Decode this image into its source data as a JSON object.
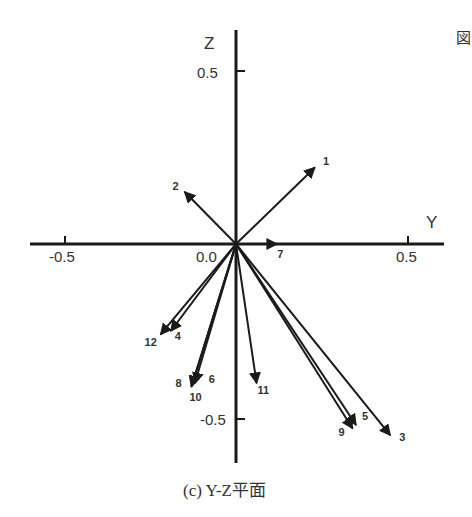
{
  "figure": {
    "fig_mark": "図",
    "caption": "(c) Y-Z平面",
    "y_axis_label": "Y",
    "z_axis_label": "Z",
    "tick_labels": {
      "y_neg": "-0.5",
      "origin": "0.0",
      "y_pos": "0.5",
      "z_pos": "0.5",
      "z_neg": "-0.5"
    }
  },
  "chart_data": {
    "type": "vector-diagram",
    "title": "(c) Y-Z平面",
    "xlabel": "Y",
    "ylabel": "Z",
    "xlim": [
      -0.6,
      0.62
    ],
    "ylim": [
      -0.63,
      0.62
    ],
    "x_ticks": [
      -0.5,
      0.0,
      0.5
    ],
    "y_ticks": [
      0.5,
      -0.5
    ],
    "vectors": [
      {
        "id": "1",
        "y": 0.23,
        "z": 0.22
      },
      {
        "id": "2",
        "y": -0.15,
        "z": 0.15
      },
      {
        "id": "3",
        "y": 0.45,
        "z": -0.55
      },
      {
        "id": "4",
        "y": -0.19,
        "z": -0.25
      },
      {
        "id": "5",
        "y": 0.35,
        "z": -0.52
      },
      {
        "id": "6",
        "y": -0.12,
        "z": -0.4
      },
      {
        "id": "7",
        "y": 0.12,
        "z": 0.0
      },
      {
        "id": "8",
        "y": -0.13,
        "z": -0.41
      },
      {
        "id": "9",
        "y": 0.34,
        "z": -0.53
      },
      {
        "id": "10",
        "y": -0.13,
        "z": -0.41
      },
      {
        "id": "11",
        "y": 0.06,
        "z": -0.4
      },
      {
        "id": "12",
        "y": -0.22,
        "z": -0.26
      }
    ]
  }
}
